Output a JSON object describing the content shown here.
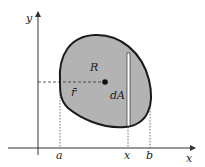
{
  "diagram": {
    "axes": {
      "x_label": "x",
      "y_label": "y"
    },
    "region_label": "R",
    "centroid_label": "r̄",
    "strip_label": "dA",
    "ticks": {
      "a": "a",
      "x": "x",
      "b": "b"
    },
    "colors": {
      "region_fill": "#b3b3b3",
      "outline": "#1a1a1a",
      "axis": "#333333",
      "strip": "#ffffff"
    }
  }
}
